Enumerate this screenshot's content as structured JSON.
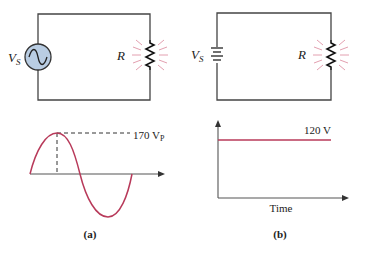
{
  "colors": {
    "wire": "#333333",
    "source_fill": "#b9cde3",
    "waveform": "#b83a5a",
    "glow": "#e3a0b0",
    "text": "#222222"
  },
  "panel_a": {
    "circuit": {
      "source_label": "V",
      "source_subscript": "S",
      "source_type": "ac-source",
      "resistor_label": "R"
    },
    "waveform": {
      "peak_label": "170 V",
      "peak_subscript": "P"
    },
    "caption": "(a)"
  },
  "panel_b": {
    "circuit": {
      "source_label": "V",
      "source_subscript": "S",
      "source_type": "battery",
      "resistor_label": "R"
    },
    "waveform": {
      "level_label": "120 V",
      "x_axis_label": "Time"
    },
    "caption": "(b)"
  }
}
